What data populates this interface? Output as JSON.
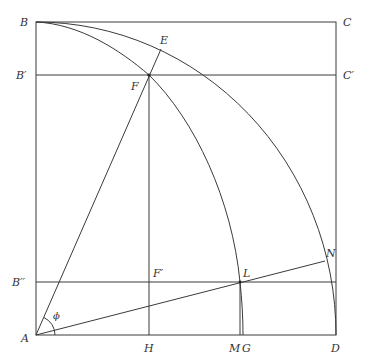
{
  "diagram": {
    "labels": {
      "B": "B",
      "C": "C",
      "E": "E",
      "F": "F",
      "B1": "B′",
      "C1": "C′",
      "B2": "B′′",
      "F1": "F′",
      "L": "L",
      "N": "N",
      "A": "A",
      "phi": "ϕ",
      "H": "H",
      "M": "M",
      "G": "G",
      "D": "D"
    },
    "points": {
      "A": [
        36,
        335
      ],
      "B": [
        36,
        22
      ],
      "C": [
        336,
        22
      ],
      "D": [
        336,
        335
      ],
      "E": [
        161,
        49
      ],
      "F": [
        149,
        75
      ],
      "F1": [
        149,
        282
      ],
      "H": [
        149,
        335
      ],
      "L": [
        240,
        282
      ],
      "N": [
        325,
        261
      ],
      "M": [
        240,
        335
      ],
      "G": [
        243,
        335
      ]
    },
    "lines": {
      "B1_C1_y": 75,
      "B2_y": 282
    },
    "stroke_color": "#3a3a3a"
  }
}
